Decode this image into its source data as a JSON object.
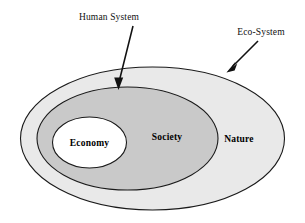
{
  "diagram": {
    "type": "nested-ellipse-venn",
    "title": "",
    "background_color": "#ffffff",
    "callouts": [
      {
        "id": "human-system",
        "label": "Human System",
        "text_x": 109,
        "text_y": 20,
        "anchor": "middle",
        "arrow": {
          "x1": 133,
          "y1": 26,
          "x2": 118.5,
          "y2": 83,
          "head_x": 118.5,
          "head_y": 89,
          "head_w": 8,
          "head_h": 12
        }
      },
      {
        "id": "eco-system",
        "label": "Eco-System",
        "text_x": 261,
        "text_y": 35,
        "anchor": "middle",
        "arrow": {
          "x1": 258,
          "y1": 41,
          "x2": 231,
          "y2": 68,
          "head_x": 226,
          "head_y": 73,
          "head_w": 8,
          "head_h": 12
        }
      }
    ],
    "regions": [
      {
        "id": "nature",
        "label": "Nature",
        "fill": "#e9e9e9",
        "stroke": "#1a1a1a",
        "cx": 152.5,
        "cy": 138.5,
        "rx": 132,
        "ry": 71.5,
        "label_x": 239,
        "label_y": 142
      },
      {
        "id": "society",
        "label": "Society",
        "fill": "#c9c9c9",
        "stroke": "#1a1a1a",
        "cx": 127.5,
        "cy": 138.5,
        "rx": 90.5,
        "ry": 51.5,
        "label_x": 167,
        "label_y": 140
      },
      {
        "id": "economy",
        "label": "Economy",
        "fill": "#ffffff",
        "stroke": "#1a1a1a",
        "cx": 89.5,
        "cy": 142.5,
        "rx": 37,
        "ry": 25.5,
        "label_x": 89.5,
        "label_y": 146
      }
    ],
    "colors": {
      "outer_fill": "#e9e9e9",
      "middle_fill": "#c9c9c9",
      "inner_fill": "#ffffff",
      "stroke": "#1a1a1a",
      "text": "#000000"
    }
  }
}
